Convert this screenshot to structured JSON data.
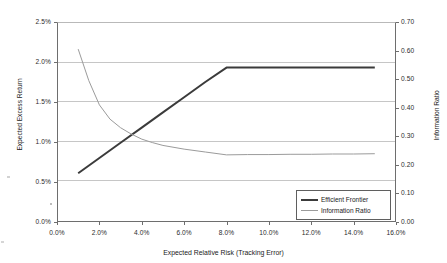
{
  "chart_data": {
    "type": "line",
    "title": "",
    "xlabel": "Expected Relative Risk (Tracking Error)",
    "ylabel": "Expected Excess Return",
    "y2label": "Information Ratio",
    "xlim": [
      0.0,
      16.0
    ],
    "ylim": [
      0.0,
      2.5
    ],
    "y2lim": [
      0.0,
      0.7
    ],
    "grid": true,
    "legend_position": "bottom-right",
    "x_ticks": [
      "0.0%",
      "2.0%",
      "4.0%",
      "6.0%",
      "8.0%",
      "10.0%",
      "12.0%",
      "14.0%",
      "16.0%"
    ],
    "y_ticks": [
      "0.0%",
      "0.5%",
      "1.0%",
      "1.5%",
      "2.0%",
      "2.5%"
    ],
    "y2_ticks": [
      "0.00",
      "0.10",
      "0.20",
      "0.30",
      "0.40",
      "0.50",
      "0.60",
      "0.70"
    ],
    "series": [
      {
        "name": "Efficient Frontier",
        "axis": "left",
        "color": "#3b3b3b",
        "width": 2,
        "x": [
          1.0,
          2.0,
          3.0,
          4.0,
          5.0,
          6.0,
          7.0,
          8.0,
          9.0,
          10.0,
          11.0,
          12.0,
          13.0,
          14.0,
          15.0
        ],
        "values": [
          0.61,
          0.8,
          0.99,
          1.18,
          1.37,
          1.56,
          1.75,
          1.93,
          1.93,
          1.93,
          1.93,
          1.93,
          1.93,
          1.93,
          1.93
        ]
      },
      {
        "name": "Information Ratio",
        "axis": "right",
        "color": "#9b9b9b",
        "width": 1,
        "x": [
          1.0,
          1.5,
          2.0,
          2.5,
          3.0,
          3.5,
          4.0,
          4.5,
          5.0,
          6.0,
          7.0,
          8.0,
          9.0,
          10.0,
          11.0,
          12.0,
          13.0,
          14.0,
          15.0
        ],
        "values": [
          0.605,
          0.495,
          0.41,
          0.36,
          0.33,
          0.308,
          0.29,
          0.278,
          0.268,
          0.255,
          0.245,
          0.235,
          0.236,
          0.236,
          0.237,
          0.237,
          0.238,
          0.238,
          0.239
        ]
      }
    ]
  },
  "legend": {
    "entries": [
      {
        "label": "Efficient Frontier"
      },
      {
        "label": "Information Ratio"
      }
    ]
  }
}
